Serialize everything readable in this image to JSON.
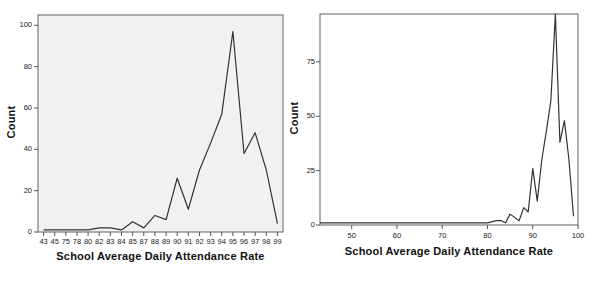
{
  "figure": {
    "background_color": "#ffffff",
    "panel_count": 2
  },
  "chart_data": [
    {
      "id": "left",
      "type": "line",
      "title": "",
      "subtitle": "",
      "xlabel": "School Average Daily Attendance Rate",
      "ylabel": "Count",
      "axis_type": "categorical",
      "grid": false,
      "legend": null,
      "plot_background": "#f1f1f1",
      "line_color": "#333333",
      "ylim": [
        0,
        105
      ],
      "yticks": [
        0,
        20,
        40,
        60,
        80,
        100
      ],
      "ytick_labels": [
        "0",
        "20",
        "40",
        "60",
        "80",
        "100"
      ],
      "categories": [
        "43",
        "45",
        "75",
        "78",
        "80",
        "82",
        "83",
        "84",
        "85",
        "87",
        "88",
        "89",
        "90",
        "91",
        "92",
        "93",
        "94",
        "95",
        "96",
        "97",
        "98",
        "99"
      ],
      "values": [
        1,
        1,
        1,
        1,
        1,
        2,
        2,
        1,
        3,
        5,
        2,
        7,
        8,
        6,
        26,
        11,
        30,
        43,
        57,
        97,
        38,
        48,
        30,
        4
      ],
      "series": [
        {
          "name": "Count",
          "x": [
            "43",
            "45",
            "75",
            "78",
            "80",
            "82",
            "83",
            "84",
            "85",
            "87",
            "88",
            "89",
            "90",
            "91",
            "92",
            "93",
            "94",
            "95",
            "96",
            "97",
            "98",
            "99"
          ],
          "values": [
            1,
            1,
            1,
            1,
            1,
            2,
            2,
            1,
            5,
            2,
            8,
            6,
            26,
            11,
            30,
            43,
            57,
            97,
            38,
            48,
            30,
            4
          ]
        }
      ]
    },
    {
      "id": "right",
      "type": "line",
      "title": "",
      "subtitle": "",
      "xlabel": "School Average Daily Attendance Rate",
      "ylabel": "Count",
      "axis_type": "numeric",
      "grid": false,
      "legend": null,
      "plot_background": "#ffffff",
      "line_color": "#333333",
      "xlim": [
        43,
        100
      ],
      "ylim": [
        0,
        97
      ],
      "xticks": [
        50,
        60,
        70,
        80,
        90,
        100
      ],
      "xtick_labels": [
        "50",
        "60",
        "70",
        "80",
        "90",
        "100"
      ],
      "yticks": [
        0,
        25,
        50,
        75
      ],
      "ytick_labels": [
        "0",
        "25",
        "50",
        "75"
      ],
      "series": [
        {
          "name": "Count",
          "x": [
            43,
            45,
            75,
            78,
            80,
            82,
            83,
            84,
            85,
            87,
            88,
            89,
            90,
            91,
            92,
            93,
            94,
            95,
            96,
            97,
            98,
            99
          ],
          "values": [
            1,
            1,
            1,
            1,
            1,
            2,
            2,
            1,
            5,
            2,
            8,
            6,
            26,
            11,
            30,
            43,
            57,
            97,
            38,
            48,
            30,
            4
          ]
        }
      ]
    }
  ]
}
